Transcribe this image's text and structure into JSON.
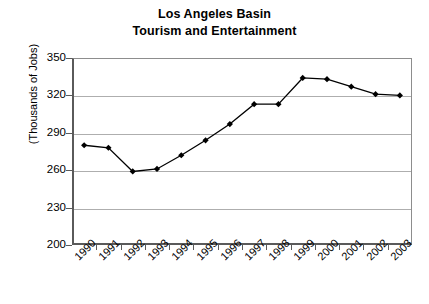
{
  "chart_data": {
    "type": "line",
    "title": "Los Angeles Basin Tourism and Entertainment",
    "title_lines": [
      "Los Angeles Basin",
      "Tourism and Entertainment"
    ],
    "xlabel": "",
    "ylabel": "(Thousands of Jobs)",
    "categories": [
      "1990",
      "1991",
      "1992",
      "1993",
      "1994",
      "1995",
      "1996",
      "1997",
      "1998",
      "1999",
      "2000",
      "2001",
      "2002",
      "2003"
    ],
    "values": [
      280,
      278,
      259,
      261,
      272,
      284,
      297,
      313,
      313,
      334,
      333,
      327,
      321,
      320
    ],
    "series": [
      {
        "name": "Tourism and Entertainment Jobs",
        "values": [
          280,
          278,
          259,
          261,
          272,
          284,
          297,
          313,
          313,
          334,
          333,
          327,
          321,
          320
        ]
      }
    ],
    "ylim": [
      200,
      350
    ],
    "yticks": [
      200,
      230,
      260,
      290,
      320,
      350
    ],
    "ytick_labels": [
      "200",
      "230",
      "260",
      "290",
      "320",
      "350"
    ],
    "xtick_rotation": -45,
    "grid": true,
    "grid_axis": "y",
    "legend": false,
    "legend_position": "none",
    "marker": "diamond",
    "line_color": "#000000",
    "marker_color": "#000000",
    "grid_color": "#aeaeae",
    "axis_color": "#5a5a5a",
    "background_color": "#ffffff"
  }
}
